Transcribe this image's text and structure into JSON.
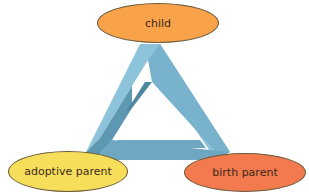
{
  "diagram": {
    "center_shape": "impossible-triangle",
    "nodes": [
      {
        "id": "child",
        "label": "child",
        "position": "top",
        "color": "#F8A24A"
      },
      {
        "id": "adoptive-parent",
        "label": "adoptive parent",
        "position": "bottom-left",
        "color": "#F7DE5A"
      },
      {
        "id": "birth-parent",
        "label": "birth parent",
        "position": "bottom-right",
        "color": "#F27A4E"
      }
    ],
    "triangle_colors": {
      "light": "#8EC3DC",
      "mid": "#6FA6C2",
      "dark": "#4F869F"
    }
  }
}
